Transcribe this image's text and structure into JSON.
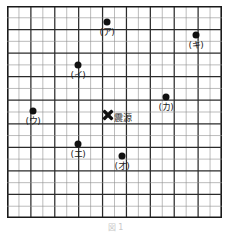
{
  "figure": {
    "title": "",
    "caption": "図 1",
    "grid": {
      "cols": 18,
      "rows": 18,
      "cell_px": 11.8,
      "origin_x_px": 7,
      "origin_y_px": 6,
      "width_px": 215,
      "height_px": 212,
      "thin_line_color": "#8f8f8f",
      "thick_line_color": "#2b2b2b",
      "border_color": "#1a1a1a",
      "major_every": 2,
      "grid_on": true
    },
    "epicenter": {
      "name": "epicenter-marker",
      "label": "震源",
      "marker": "x-cross",
      "color": "#111111",
      "x_px": 108,
      "y_px": 112,
      "grid_col": 8.5,
      "grid_row": 9,
      "label_x_px": 114,
      "label_y_px": 113
    },
    "points": [
      {
        "id": "a",
        "label": "(ア)",
        "x_px": 107,
        "y_px": 22,
        "grid_col": 8.5,
        "grid_row": 1.4,
        "label_x_px": 107,
        "label_y_px": 27
      },
      {
        "id": "ki",
        "label": "(キ)",
        "x_px": 196,
        "y_px": 35,
        "grid_col": 16,
        "grid_row": 2.5,
        "label_x_px": 196,
        "label_y_px": 40
      },
      {
        "id": "i",
        "label": "(イ)",
        "x_px": 78,
        "y_px": 65,
        "grid_col": 6,
        "grid_row": 5,
        "label_x_px": 78,
        "label_y_px": 70
      },
      {
        "id": "ka",
        "label": "(カ)",
        "x_px": 166,
        "y_px": 97,
        "grid_col": 13.5,
        "grid_row": 7.7,
        "label_x_px": 166,
        "label_y_px": 102
      },
      {
        "id": "u",
        "label": "(ウ)",
        "x_px": 33,
        "y_px": 111,
        "grid_col": 2.2,
        "grid_row": 8.9,
        "label_x_px": 33,
        "label_y_px": 116
      },
      {
        "id": "e",
        "label": "(エ)",
        "x_px": 78,
        "y_px": 144,
        "grid_col": 6,
        "grid_row": 11.7,
        "label_x_px": 78,
        "label_y_px": 149
      },
      {
        "id": "o",
        "label": "(オ)",
        "x_px": 122,
        "y_px": 156,
        "grid_col": 9.7,
        "grid_row": 12.7,
        "label_x_px": 122,
        "label_y_px": 161
      }
    ]
  }
}
